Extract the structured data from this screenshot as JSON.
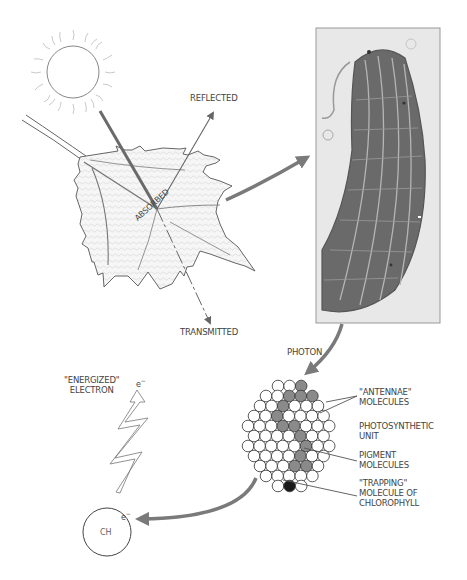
{
  "labels": {
    "reflected": "REFLECTED",
    "absorbed": "ABSORBED",
    "transmitted": "TRANSMITTED",
    "photon": "PHOTON",
    "energized_electron": [
      "\"ENERGIZED\"",
      "ELECTRON"
    ],
    "electron_symbol": "e",
    "electron_superscript": "−",
    "antennae_molecules": [
      "\"ANTENNAE\"",
      "MOLECULES"
    ],
    "photosynthetic_unit": [
      "PHOTOSYNTHETIC",
      "UNIT"
    ],
    "pigment_molecules": [
      "PIGMENT",
      "MOLECULES"
    ],
    "trapping_molecule": [
      "\"TRAPPING\"",
      "MOLECULE OF",
      "CHLOROPHYLL"
    ],
    "acceptor": "CH"
  },
  "icons": {
    "sun": "sun-icon",
    "leaf": "leaf-illustration",
    "chloroplast": "chloroplast-micrograph",
    "lightning": "energized-electron-zigzag",
    "molecule_cluster": "photosynthetic-unit-cluster"
  },
  "colors": {
    "line": "#555555",
    "arrow": "#7a7a7a",
    "pigment": "#8a8a8a",
    "trap": "#1a1a1a",
    "micrograph_bg": "#e6e6e6",
    "micrograph_dark": "#5e5e5e"
  }
}
